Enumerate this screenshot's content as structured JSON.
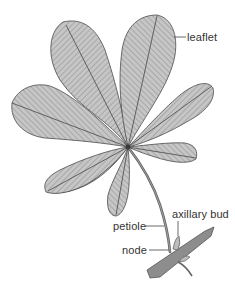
{
  "diagram": {
    "labels": {
      "leaflet": "leaflet",
      "petiole": "petiole",
      "axillary_bud": "axillary bud",
      "node": "node"
    },
    "colors": {
      "leaf_fill": "#c4c4c4",
      "outline": "#4a4a4a",
      "vein": "#5a5a5a",
      "stem": "#8a8a8a",
      "label_text": "#333333"
    },
    "leaflet_count": 7
  }
}
